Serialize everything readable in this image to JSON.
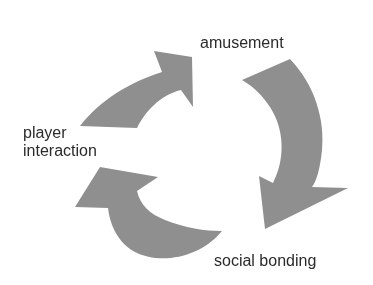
{
  "diagram": {
    "type": "cycle",
    "nodes": [
      {
        "id": "amusement",
        "label": "amusement"
      },
      {
        "id": "social_bonding",
        "label": "social bonding"
      },
      {
        "id": "player_interaction",
        "label": "player interaction",
        "lines": [
          "player",
          "interaction"
        ]
      }
    ],
    "edges": [
      {
        "from": "player_interaction",
        "to": "amusement",
        "style": "curved-arrow"
      },
      {
        "from": "amusement",
        "to": "social_bonding",
        "style": "curved-arrow"
      },
      {
        "from": "social_bonding",
        "to": "player_interaction",
        "style": "curved-arrow"
      }
    ],
    "colors": {
      "arrow": "#8f8f8f",
      "text": "#2b2b2b",
      "background": "#ffffff"
    }
  }
}
